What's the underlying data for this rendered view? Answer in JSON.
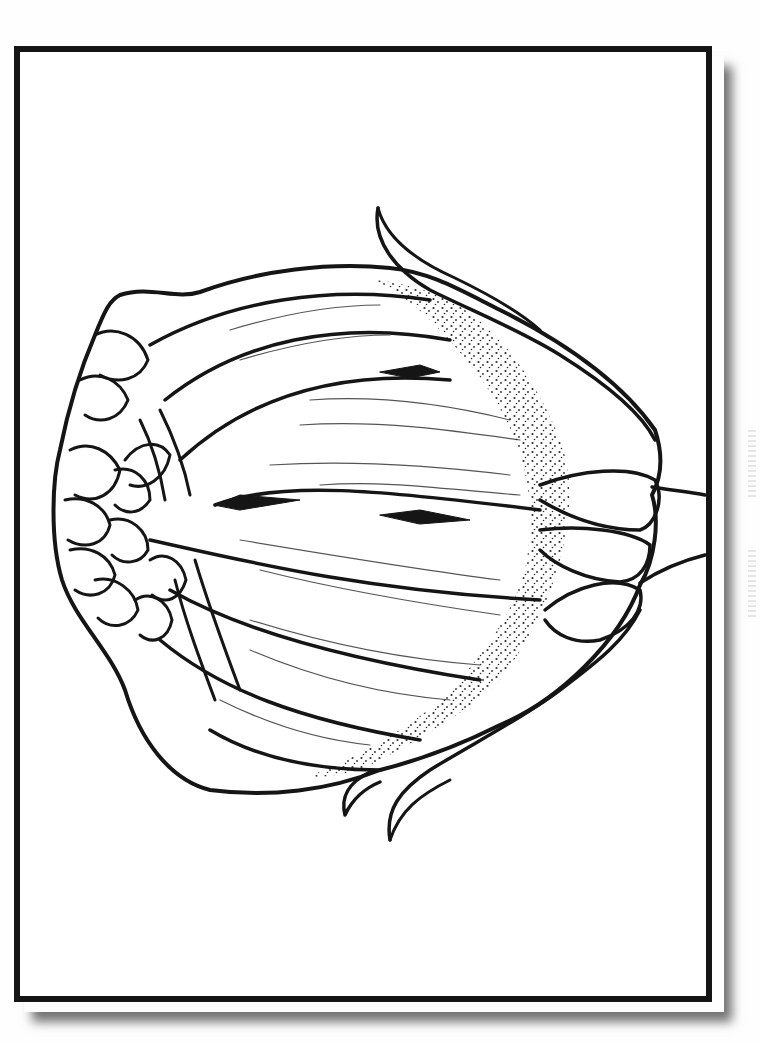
{
  "page": {
    "type": "coloring-page",
    "colors": {
      "ink": "#151515",
      "paper": "#ffffff",
      "frame": "#151515",
      "shadow": "#555555"
    }
  }
}
